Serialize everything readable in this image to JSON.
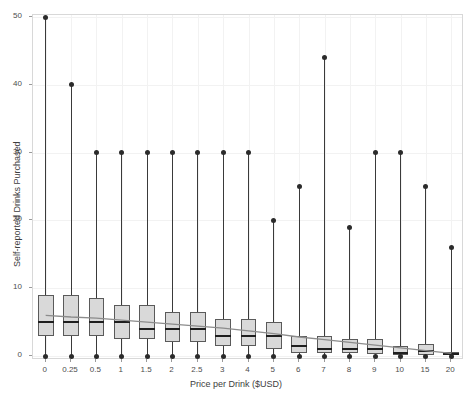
{
  "chart_data": {
    "type": "bar",
    "plot_kind": "boxplot-with-trendline",
    "title": "",
    "subtitle": "",
    "xlabel": "Price per Drink ($USD)",
    "ylabel": "Self-reported Drinks Purchased",
    "categories": [
      "0",
      "0.25",
      "0.5",
      "1",
      "1.5",
      "2",
      "2.5",
      "3",
      "4",
      "5",
      "6",
      "7",
      "8",
      "9",
      "10",
      "15",
      "20"
    ],
    "ylim": [
      0,
      50
    ],
    "yticks": [
      0,
      10,
      20,
      30,
      40,
      50
    ],
    "ytick_labels": [
      "0",
      "10",
      "20",
      "30",
      "40",
      "50"
    ],
    "grid": true,
    "legend": "none",
    "colors": {
      "box_fill": "#d9d9d9",
      "box_border": "#5a5a5a",
      "median": "#1f1f1f",
      "whisker": "#3a3a3a",
      "outlier": "#2b2b2b",
      "trendline": "#8c8c8c",
      "panel_border": "#d8d8d8",
      "grid": "#f2f2f2",
      "background": "#ffffff"
    },
    "boxes": [
      {
        "category": "0",
        "q1": 3.0,
        "median": 5.0,
        "q3": 9.0,
        "whisker_low": 0,
        "whisker_high": 50,
        "outlier_low": 0,
        "outlier_high": 50
      },
      {
        "category": "0.25",
        "q1": 3.0,
        "median": 5.0,
        "q3": 9.0,
        "whisker_low": 0,
        "whisker_high": 40,
        "outlier_low": 0,
        "outlier_high": 40
      },
      {
        "category": "0.5",
        "q1": 3.0,
        "median": 5.0,
        "q3": 8.5,
        "whisker_low": 0,
        "whisker_high": 30,
        "outlier_low": 0,
        "outlier_high": 30
      },
      {
        "category": "1",
        "q1": 2.5,
        "median": 5.0,
        "q3": 7.5,
        "whisker_low": 0,
        "whisker_high": 30,
        "outlier_low": 0,
        "outlier_high": 30
      },
      {
        "category": "1.5",
        "q1": 2.5,
        "median": 4.0,
        "q3": 7.5,
        "whisker_low": 0,
        "whisker_high": 30,
        "outlier_low": 0,
        "outlier_high": 30
      },
      {
        "category": "2",
        "q1": 2.0,
        "median": 4.0,
        "q3": 6.5,
        "whisker_low": 0,
        "whisker_high": 30,
        "outlier_low": 0,
        "outlier_high": 30
      },
      {
        "category": "2.5",
        "q1": 2.0,
        "median": 4.0,
        "q3": 6.5,
        "whisker_low": 0,
        "whisker_high": 30,
        "outlier_low": 0,
        "outlier_high": 30
      },
      {
        "category": "3",
        "q1": 1.5,
        "median": 3.0,
        "q3": 5.5,
        "whisker_low": 0,
        "whisker_high": 30,
        "outlier_low": 0,
        "outlier_high": 30
      },
      {
        "category": "4",
        "q1": 1.5,
        "median": 3.0,
        "q3": 5.5,
        "whisker_low": 0,
        "whisker_high": 30,
        "outlier_low": 0,
        "outlier_high": 30
      },
      {
        "category": "5",
        "q1": 1.0,
        "median": 3.0,
        "q3": 5.0,
        "whisker_low": 0,
        "whisker_high": 20,
        "outlier_low": 0,
        "outlier_high": 20
      },
      {
        "category": "6",
        "q1": 0.5,
        "median": 1.5,
        "q3": 3.0,
        "whisker_low": 0,
        "whisker_high": 25,
        "outlier_low": 0,
        "outlier_high": 25
      },
      {
        "category": "7",
        "q1": 0.5,
        "median": 1.0,
        "q3": 3.0,
        "whisker_low": 0,
        "whisker_high": 44,
        "outlier_low": 0,
        "outlier_high": 44
      },
      {
        "category": "8",
        "q1": 0.5,
        "median": 1.0,
        "q3": 2.5,
        "whisker_low": 0,
        "whisker_high": 19,
        "outlier_low": 0,
        "outlier_high": 19
      },
      {
        "category": "9",
        "q1": 0.3,
        "median": 1.0,
        "q3": 2.5,
        "whisker_low": 0,
        "whisker_high": 30,
        "outlier_low": 0,
        "outlier_high": 30
      },
      {
        "category": "10",
        "q1": 0.2,
        "median": 0.5,
        "q3": 1.5,
        "whisker_low": 0,
        "whisker_high": 30,
        "outlier_low": 0,
        "outlier_high": 30
      },
      {
        "category": "15",
        "q1": 0.2,
        "median": 0.8,
        "q3": 1.8,
        "whisker_low": 0,
        "whisker_high": 25,
        "outlier_low": 0,
        "outlier_high": 25
      },
      {
        "category": "20",
        "q1": 0.1,
        "median": 0.3,
        "q3": 0.6,
        "whisker_low": 0,
        "whisker_high": 16,
        "outlier_low": 0,
        "outlier_high": 16
      }
    ],
    "trendline": {
      "name": "linear fit",
      "x_values": [
        "0",
        "20"
      ],
      "y_start": 6.0,
      "y_end": 0.4,
      "points": [
        {
          "category": "0",
          "y": 6.0
        },
        {
          "category": "0.25",
          "y": 5.75
        },
        {
          "category": "0.5",
          "y": 5.6
        },
        {
          "category": "1",
          "y": 5.3
        },
        {
          "category": "1.5",
          "y": 5.0
        },
        {
          "category": "2",
          "y": 4.7
        },
        {
          "category": "2.5",
          "y": 4.4
        },
        {
          "category": "3",
          "y": 4.1
        },
        {
          "category": "4",
          "y": 3.7
        },
        {
          "category": "5",
          "y": 3.3
        },
        {
          "category": "6",
          "y": 2.8
        },
        {
          "category": "7",
          "y": 2.4
        },
        {
          "category": "8",
          "y": 2.0
        },
        {
          "category": "9",
          "y": 1.6
        },
        {
          "category": "10",
          "y": 1.2
        },
        {
          "category": "15",
          "y": 0.8
        },
        {
          "category": "20",
          "y": 0.4
        }
      ]
    }
  }
}
